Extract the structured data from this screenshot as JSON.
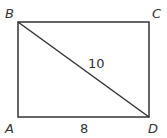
{
  "diagram": {
    "type": "rectangle-with-diagonal",
    "vertices": {
      "A": {
        "label": "A",
        "x": 18,
        "y": 117
      },
      "B": {
        "label": "B",
        "x": 18,
        "y": 22
      },
      "C": {
        "label": "C",
        "x": 149,
        "y": 22
      },
      "D": {
        "label": "D",
        "x": 149,
        "y": 117
      }
    },
    "segments": [
      {
        "from": "A",
        "to": "B"
      },
      {
        "from": "B",
        "to": "C"
      },
      {
        "from": "C",
        "to": "D"
      },
      {
        "from": "D",
        "to": "A"
      },
      {
        "from": "B",
        "to": "D"
      }
    ],
    "measurements": {
      "AD": "8",
      "BD": "10"
    },
    "colors": {
      "stroke": "#333333",
      "background": "#ffffff"
    }
  }
}
